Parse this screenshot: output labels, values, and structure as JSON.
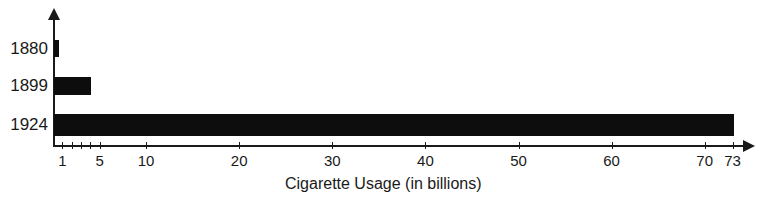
{
  "chart_data": {
    "type": "bar",
    "orientation": "horizontal",
    "title": "",
    "xlabel": "Cigarette Usage (in billions)",
    "ylabel": "",
    "categories": [
      "1880",
      "1899",
      "1924"
    ],
    "values": [
      0.5,
      4,
      73
    ],
    "xlim": [
      0,
      73
    ],
    "x_ticks": [
      1,
      2,
      3,
      4,
      5,
      10,
      20,
      30,
      40,
      50,
      60,
      70,
      73
    ],
    "x_tick_labels": [
      "1",
      "",
      "",
      "",
      "5",
      "10",
      "20",
      "30",
      "40",
      "50",
      "60",
      "70",
      "73"
    ],
    "grid": false,
    "legend": null,
    "bar_color": "#0d0d0d"
  }
}
